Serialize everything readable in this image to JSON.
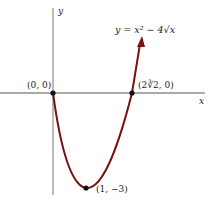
{
  "figure": {
    "equation": "y = x² − 4√x",
    "axis_x_label": "x",
    "axis_y_label": "y",
    "points": [
      {
        "label": "(0, 0)"
      },
      {
        "label": "(2∛2, 0)"
      },
      {
        "label": "(1, −3)"
      }
    ],
    "curve_color": "#7a1010",
    "axis_color": "#555555"
  }
}
